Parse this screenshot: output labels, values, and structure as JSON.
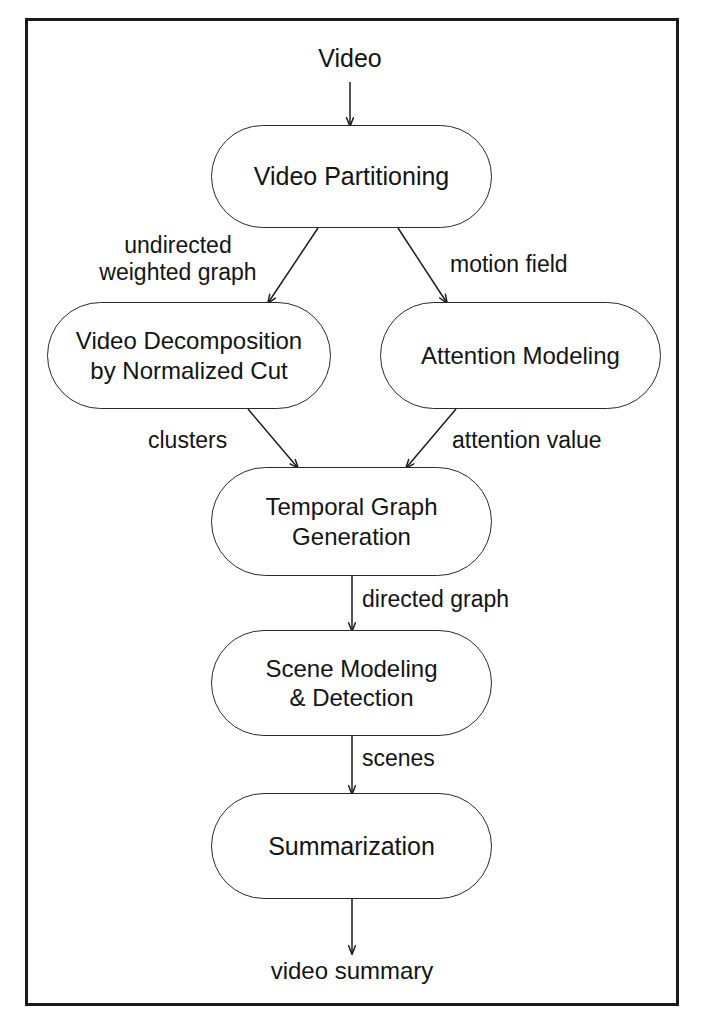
{
  "figure": {
    "type": "flowchart",
    "orientation": "top-to-bottom",
    "frame_color": "#1a1a1a",
    "node_border_color": "#2a2a2a",
    "background_color": "#ffffff",
    "text_color": "#141414"
  },
  "io": {
    "input_label": "Video",
    "output_label": "video summary"
  },
  "nodes": [
    {
      "id": "video-partitioning",
      "label": "Video Partitioning"
    },
    {
      "id": "video-decomposition",
      "label": "Video Decomposition\nby Normalized Cut"
    },
    {
      "id": "attention-modeling",
      "label": "Attention Modeling"
    },
    {
      "id": "temporal-graph-generation",
      "label": "Temporal Graph\nGeneration"
    },
    {
      "id": "scene-modeling-detection",
      "label": "Scene Modeling\n& Detection"
    },
    {
      "id": "summarization",
      "label": "Summarization"
    }
  ],
  "edge_labels": [
    {
      "id": "undirected-weighted-graph",
      "text": "undirected\nweighted graph"
    },
    {
      "id": "motion-field",
      "text": "motion field"
    },
    {
      "id": "clusters",
      "text": "clusters"
    },
    {
      "id": "attention-value",
      "text": "attention value"
    },
    {
      "id": "directed-graph",
      "text": "directed graph"
    },
    {
      "id": "scenes",
      "text": "scenes"
    }
  ],
  "edges": [
    {
      "from": "Video",
      "to": "Video Partitioning",
      "label": ""
    },
    {
      "from": "Video Partitioning",
      "to": "Video Decomposition by Normalized Cut",
      "label": "undirected weighted graph"
    },
    {
      "from": "Video Partitioning",
      "to": "Attention Modeling",
      "label": "motion field"
    },
    {
      "from": "Video Decomposition by Normalized Cut",
      "to": "Temporal Graph Generation",
      "label": "clusters"
    },
    {
      "from": "Attention Modeling",
      "to": "Temporal Graph Generation",
      "label": "attention value"
    },
    {
      "from": "Temporal Graph Generation",
      "to": "Scene Modeling & Detection",
      "label": "directed graph"
    },
    {
      "from": "Scene Modeling & Detection",
      "to": "Summarization",
      "label": "scenes"
    },
    {
      "from": "Summarization",
      "to": "video summary",
      "label": ""
    }
  ]
}
